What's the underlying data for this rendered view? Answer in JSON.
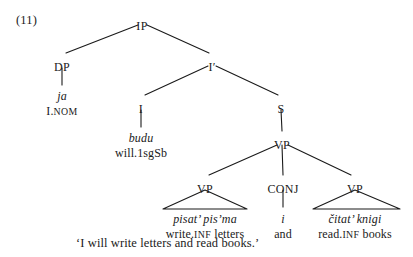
{
  "figure": {
    "example_number": "(11)",
    "translation": "‘I will write letters and read books.’",
    "language_note": "",
    "ink_color": "#1a1a1a",
    "background_color": "#ffffff"
  },
  "tree": {
    "nodes": [
      {
        "id": "IP",
        "label": "IP",
        "x": 142,
        "y": 20
      },
      {
        "id": "DP",
        "label": "DP",
        "x": 62,
        "y": 61
      },
      {
        "id": "Ibar",
        "label": "I′",
        "x": 212,
        "y": 61
      },
      {
        "id": "I",
        "label": "I",
        "x": 141,
        "y": 103
      },
      {
        "id": "S",
        "label": "S",
        "x": 281,
        "y": 103
      },
      {
        "id": "VPtop",
        "label": "VP",
        "x": 282,
        "y": 139
      },
      {
        "id": "VP1",
        "label": "VP",
        "x": 205,
        "y": 183
      },
      {
        "id": "CONJ",
        "label": "CONJ",
        "x": 283,
        "y": 183
      },
      {
        "id": "VP2",
        "label": "VP",
        "x": 355,
        "y": 183
      }
    ],
    "edges": [
      {
        "from": "IP",
        "to": "DP",
        "x1": 138,
        "y1": 25,
        "x2": 66,
        "y2": 53
      },
      {
        "from": "IP",
        "to": "Ibar",
        "x1": 147,
        "y1": 25,
        "x2": 209,
        "y2": 53
      },
      {
        "from": "Ibar",
        "to": "I",
        "x1": 208,
        "y1": 66,
        "x2": 145,
        "y2": 95
      },
      {
        "from": "Ibar",
        "to": "S",
        "x1": 216,
        "y1": 66,
        "x2": 278,
        "y2": 95
      },
      {
        "from": "DP",
        "to": "ja",
        "x1": 62,
        "y1": 68,
        "x2": 62,
        "y2": 85
      },
      {
        "from": "I",
        "to": "budu",
        "x1": 141,
        "y1": 110,
        "x2": 141,
        "y2": 127
      },
      {
        "from": "S",
        "to": "VPtop",
        "x1": 281,
        "y1": 110,
        "x2": 282,
        "y2": 131
      },
      {
        "from": "VPtop",
        "to": "VP1",
        "x1": 277,
        "y1": 145,
        "x2": 209,
        "y2": 175
      },
      {
        "from": "VPtop",
        "to": "CONJ",
        "x1": 282,
        "y1": 145,
        "x2": 283,
        "y2": 175
      },
      {
        "from": "VPtop",
        "to": "VP2",
        "x1": 288,
        "y1": 145,
        "x2": 351,
        "y2": 175
      },
      {
        "from": "CONJ",
        "to": "i",
        "x1": 283,
        "y1": 190,
        "x2": 283,
        "y2": 207
      }
    ],
    "triangles": [
      {
        "under": "VP1",
        "apex_x": 205,
        "apex_y": 190,
        "left_x": 163,
        "right_x": 247,
        "base_y": 209
      },
      {
        "under": "VP2",
        "apex_x": 355,
        "apex_y": 190,
        "left_x": 313,
        "right_x": 400,
        "base_y": 209
      }
    ],
    "terminals": [
      {
        "id": "ja",
        "form": "ja",
        "gloss_parts": [
          {
            "text": "I.",
            "smallcaps": false
          },
          {
            "text": "nom",
            "smallcaps": true
          }
        ],
        "x": 62,
        "form_y": 90,
        "gloss_y": 105
      },
      {
        "id": "budu",
        "form": "budu",
        "gloss_parts": [
          {
            "text": "will.1sgSb",
            "smallcaps": false
          }
        ],
        "x": 141,
        "form_y": 132,
        "gloss_y": 147
      },
      {
        "id": "vp1",
        "form": "pisat’ pis’ma",
        "gloss_parts": [
          {
            "text": "write.",
            "smallcaps": false
          },
          {
            "text": "inf",
            "smallcaps": true
          },
          {
            "text": " letters",
            "smallcaps": false
          }
        ],
        "x": 205,
        "form_y": 213,
        "gloss_y": 228
      },
      {
        "id": "i",
        "form": "i",
        "gloss_parts": [
          {
            "text": "and",
            "smallcaps": false
          }
        ],
        "x": 283,
        "form_y": 213,
        "gloss_y": 228
      },
      {
        "id": "vp2",
        "form": "čitat’ knigi",
        "gloss_parts": [
          {
            "text": "read.",
            "smallcaps": false
          },
          {
            "text": "inf",
            "smallcaps": true
          },
          {
            "text": " books",
            "smallcaps": false
          }
        ],
        "x": 355,
        "form_y": 213,
        "gloss_y": 228
      }
    ]
  },
  "positions": {
    "example_number": {
      "x": 16,
      "y": 14
    },
    "translation": {
      "x": 76,
      "y": 237
    }
  }
}
